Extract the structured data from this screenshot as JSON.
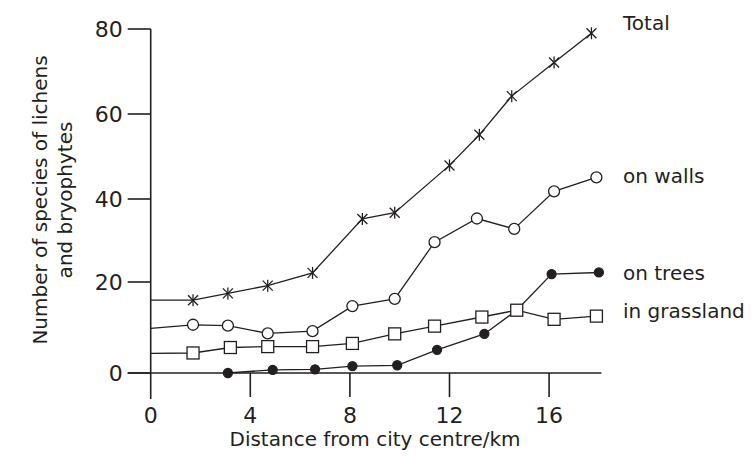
{
  "chart_data": {
    "type": "line",
    "title": "",
    "xlabel": "Distance from city centre/km",
    "ylabel": [
      "Number of species of lichens",
      "and bryophytes"
    ],
    "xlim": [
      0,
      18
    ],
    "ylim": [
      0,
      80
    ],
    "xticks": [
      0,
      4,
      8,
      12,
      16
    ],
    "yticks": [
      0,
      20,
      40,
      60,
      80
    ],
    "grid": false,
    "legend_position": "inline-right",
    "series": [
      {
        "name": "Total",
        "marker": "cross",
        "x": [
          0,
          1.7,
          3.1,
          4.7,
          6.5,
          8.5,
          9.8,
          12.0,
          13.2,
          14.5,
          16.2,
          17.7
        ],
        "y": [
          16,
          16.0,
          17.5,
          19.2,
          22.2,
          35.2,
          36.7,
          47.9,
          55.1,
          64.2,
          72.1,
          79.0
        ],
        "marker_start": 1
      },
      {
        "name": "on walls",
        "marker": "open-circle",
        "x": [
          0,
          1.7,
          3.1,
          4.7,
          6.5,
          8.1,
          9.8,
          11.4,
          13.1,
          14.6,
          16.2,
          17.9
        ],
        "y": [
          9.8,
          10.6,
          10.4,
          8.7,
          9.2,
          14.7,
          16.3,
          29.6,
          35.3,
          32.8,
          41.8,
          45.1
        ],
        "marker_start": 1
      },
      {
        "name": "on trees",
        "marker": "filled-circle",
        "x": [
          3.1,
          4.9,
          6.6,
          8.1,
          9.9,
          11.5,
          13.4,
          14.7,
          16.1,
          18.0
        ],
        "y": [
          0,
          0.7,
          0.8,
          1.5,
          1.7,
          5.1,
          8.6,
          13.8,
          21.9,
          22.3
        ],
        "marker_start": 0
      },
      {
        "name": "in grassland",
        "marker": "open-square",
        "x": [
          0,
          1.7,
          3.2,
          4.7,
          6.5,
          8.1,
          9.8,
          11.4,
          13.3,
          14.7,
          16.2,
          17.9
        ],
        "y": [
          4.3,
          4.4,
          5.6,
          5.8,
          5.8,
          6.5,
          8.6,
          10.3,
          12.3,
          13.8,
          11.8,
          12.5
        ],
        "marker_start": 1
      }
    ],
    "series_labels": [
      "Total",
      "on walls",
      "on trees",
      "in grassland"
    ]
  },
  "layout_px": {
    "x0": 150.7,
    "px_per_km": 24.9,
    "y_ticks_px": {
      "0": 373,
      "20": 282,
      "40": 199,
      "60": 114,
      "80": 29
    },
    "label_y_px": [
      30,
      183,
      280,
      318
    ]
  },
  "colors": {
    "ink": "#231f20",
    "background": "#ffffff"
  }
}
